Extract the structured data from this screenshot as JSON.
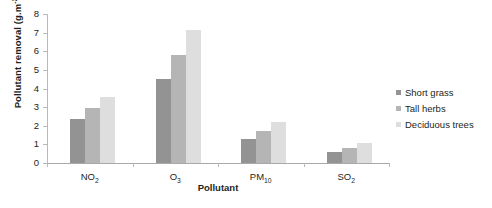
{
  "chart_data": {
    "type": "bar",
    "title": "",
    "xlabel": "Pollutant",
    "ylabel": "Pollutant removal (g.m-2.y-1)",
    "ylabel_parts": {
      "base": "Pollutant removal (g.m",
      "sup1": "-2",
      "mid": ".y",
      "sup2": "-1",
      "close": ")"
    },
    "categories": [
      "NO2",
      "O3",
      "PM10",
      "SO2"
    ],
    "category_labels": [
      {
        "base": "NO",
        "sub": "2"
      },
      {
        "base": "O",
        "sub": "3"
      },
      {
        "base": "PM",
        "sub": "10"
      },
      {
        "base": "SO",
        "sub": "2"
      }
    ],
    "series": [
      {
        "name": "Short grass",
        "color": "#939393",
        "values": [
          2.35,
          4.5,
          1.3,
          0.6
        ]
      },
      {
        "name": "Tall herbs",
        "color": "#b5b5b5",
        "values": [
          2.95,
          5.8,
          1.7,
          0.8
        ]
      },
      {
        "name": "Deciduous trees",
        "color": "#dedede",
        "values": [
          3.55,
          7.15,
          2.2,
          1.1
        ]
      }
    ],
    "ylim": [
      0,
      8
    ],
    "y_ticks": [
      0,
      1,
      2,
      3,
      4,
      5,
      6,
      7,
      8
    ],
    "y_tick_labels": [
      "0",
      "1",
      "2",
      "3",
      "4",
      "5",
      "6",
      "7",
      "8"
    ],
    "grid": false,
    "legend_position": "right"
  },
  "legend": {
    "items": [
      {
        "label": "Short grass",
        "color": "#939393"
      },
      {
        "label": "Tall herbs",
        "color": "#b5b5b5"
      },
      {
        "label": "Deciduous trees",
        "color": "#dedede"
      }
    ]
  }
}
